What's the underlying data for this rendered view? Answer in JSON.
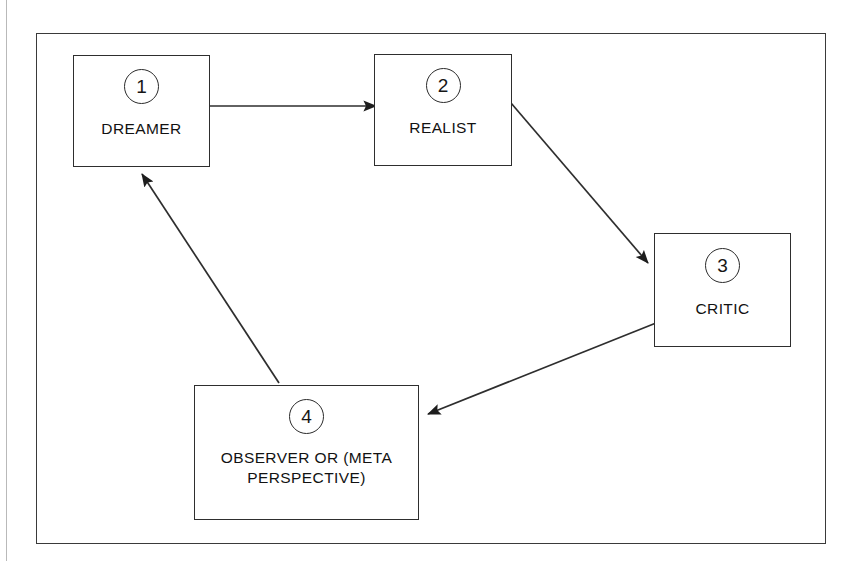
{
  "figure": {
    "background_color": "#ffffff",
    "line_color": "#2e2e2e"
  },
  "nodes": [
    {
      "id": "dreamer",
      "number": "1",
      "label": "DREAMER"
    },
    {
      "id": "realist",
      "number": "2",
      "label": "REALIST"
    },
    {
      "id": "critic",
      "number": "3",
      "label": "CRITIC"
    },
    {
      "id": "observer",
      "number": "4",
      "label": "OBSERVER OR (META\nPERSPECTIVE)"
    }
  ],
  "connectors": [
    {
      "id": "dreamer-to-realist",
      "from": "dreamer",
      "to": "realist",
      "style": "straight-arrow"
    },
    {
      "id": "realist-to-critic",
      "from": "realist",
      "to": "critic",
      "style": "straight-arrow"
    },
    {
      "id": "critic-to-observer",
      "from": "critic",
      "to": "observer",
      "style": "straight-arrow"
    },
    {
      "id": "observer-to-dreamer",
      "from": "observer",
      "to": "dreamer",
      "style": "straight-arrow"
    }
  ]
}
